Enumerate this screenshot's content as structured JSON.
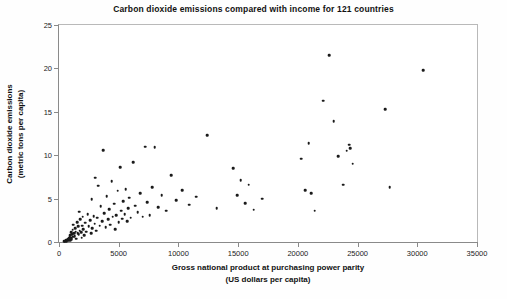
{
  "chart_data": {
    "type": "scatter",
    "title": "Carbon dioxide emissions compared with income for 121 countries",
    "xlabel_line1": "Gross national product at purchasing power parity",
    "xlabel_line2": "(US dollars per capita)",
    "ylabel_line1": "Carbon dioxide emissions",
    "ylabel_line2": "(metric tons per capita)",
    "xlim": [
      0,
      35000
    ],
    "ylim": [
      0,
      25
    ],
    "xticks": [
      0,
      5000,
      10000,
      15000,
      20000,
      25000,
      30000,
      35000
    ],
    "xticklabels": [
      "0",
      "5000",
      "10000",
      "15000",
      "20000",
      "25000",
      "30000",
      "35000"
    ],
    "yticks": [
      0,
      5,
      10,
      15,
      20,
      25
    ],
    "yticklabels": [
      "0",
      "5",
      "10",
      "15",
      "20",
      "25"
    ],
    "grid": false,
    "legend": null,
    "marker": "filled-circle",
    "marker_color": "#1a1a1a",
    "n_points": 121,
    "points": [
      [
        430,
        0.1
      ],
      [
        520,
        0.1
      ],
      [
        560,
        0.15
      ],
      [
        620,
        0.2
      ],
      [
        650,
        0.1
      ],
      [
        700,
        0.25
      ],
      [
        740,
        0.2
      ],
      [
        780,
        0.35
      ],
      [
        800,
        0.15
      ],
      [
        830,
        0.45
      ],
      [
        860,
        0.3
      ],
      [
        900,
        0.6
      ],
      [
        930,
        0.2
      ],
      [
        960,
        0.8
      ],
      [
        1000,
        0.5
      ],
      [
        1030,
        1.1
      ],
      [
        1060,
        0.35
      ],
      [
        1100,
        0.9
      ],
      [
        1150,
        1.4
      ],
      [
        1180,
        0.6
      ],
      [
        1200,
        2.0
      ],
      [
        1250,
        1.0
      ],
      [
        1300,
        0.7
      ],
      [
        1350,
        1.6
      ],
      [
        1400,
        1.2
      ],
      [
        1450,
        0.4
      ],
      [
        1500,
        2.3
      ],
      [
        1550,
        1.0
      ],
      [
        1600,
        1.8
      ],
      [
        1650,
        0.9
      ],
      [
        1700,
        3.5
      ],
      [
        1750,
        1.3
      ],
      [
        1800,
        2.6
      ],
      [
        1850,
        1.1
      ],
      [
        1900,
        0.5
      ],
      [
        1950,
        1.9
      ],
      [
        2000,
        2.9
      ],
      [
        2050,
        1.5
      ],
      [
        2100,
        0.8
      ],
      [
        2200,
        2.2
      ],
      [
        2300,
        1.2
      ],
      [
        2400,
        3.2
      ],
      [
        2500,
        1.8
      ],
      [
        2600,
        2.5
      ],
      [
        2700,
        1.0
      ],
      [
        2750,
        4.9
      ],
      [
        2800,
        1.6
      ],
      [
        2900,
        3.0
      ],
      [
        3000,
        2.1
      ],
      [
        3050,
        7.4
      ],
      [
        3100,
        1.3
      ],
      [
        3200,
        2.8
      ],
      [
        3300,
        6.5
      ],
      [
        3400,
        1.9
      ],
      [
        3500,
        4.1
      ],
      [
        3600,
        2.4
      ],
      [
        3700,
        10.6
      ],
      [
        3800,
        3.3
      ],
      [
        3900,
        1.7
      ],
      [
        4000,
        5.3
      ],
      [
        4100,
        2.6
      ],
      [
        4200,
        3.8
      ],
      [
        4300,
        2.0
      ],
      [
        4400,
        7.0
      ],
      [
        4500,
        2.9
      ],
      [
        4600,
        4.4
      ],
      [
        4700,
        1.5
      ],
      [
        4800,
        3.1
      ],
      [
        4900,
        5.9
      ],
      [
        5000,
        2.3
      ],
      [
        5100,
        8.6
      ],
      [
        5200,
        3.6
      ],
      [
        5300,
        2.7
      ],
      [
        5400,
        4.7
      ],
      [
        5500,
        3.2
      ],
      [
        5600,
        6.1
      ],
      [
        5700,
        2.4
      ],
      [
        5800,
        3.9
      ],
      [
        5900,
        5.1
      ],
      [
        6000,
        2.8
      ],
      [
        6200,
        9.2
      ],
      [
        6400,
        4.2
      ],
      [
        6600,
        3.4
      ],
      [
        6800,
        5.6
      ],
      [
        7000,
        2.9
      ],
      [
        7200,
        11.0
      ],
      [
        7400,
        4.6
      ],
      [
        7600,
        3.1
      ],
      [
        7800,
        6.3
      ],
      [
        8000,
        10.9
      ],
      [
        8300,
        4.0
      ],
      [
        8600,
        5.4
      ],
      [
        9000,
        3.6
      ],
      [
        9400,
        7.7
      ],
      [
        9800,
        4.8
      ],
      [
        10300,
        6.0
      ],
      [
        10900,
        4.3
      ],
      [
        11500,
        5.2
      ],
      [
        12400,
        12.3
      ],
      [
        13200,
        3.9
      ],
      [
        14600,
        8.5
      ],
      [
        14900,
        5.4
      ],
      [
        15200,
        7.1
      ],
      [
        15600,
        4.5
      ],
      [
        15900,
        6.6
      ],
      [
        16300,
        3.7
      ],
      [
        17000,
        5.0
      ],
      [
        20300,
        9.6
      ],
      [
        20600,
        6.0
      ],
      [
        20900,
        11.4
      ],
      [
        21100,
        5.6
      ],
      [
        21400,
        3.6
      ],
      [
        22100,
        16.3
      ],
      [
        22600,
        21.5
      ],
      [
        23000,
        13.9
      ],
      [
        23400,
        9.9
      ],
      [
        23800,
        6.6
      ],
      [
        24100,
        10.5
      ],
      [
        24300,
        11.2
      ],
      [
        24400,
        10.8
      ],
      [
        24600,
        9.0
      ],
      [
        27300,
        15.3
      ],
      [
        27700,
        6.3
      ],
      [
        30500,
        19.8
      ]
    ]
  }
}
